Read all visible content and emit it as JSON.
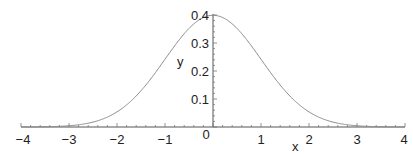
{
  "chart_data": {
    "type": "line",
    "title": "",
    "xlabel": "x",
    "ylabel": "y",
    "xlim": [
      -4,
      4
    ],
    "ylim": [
      0,
      0.4
    ],
    "grid": false,
    "legend": null,
    "x_ticks": [
      -4,
      -3,
      -2,
      -1,
      0,
      1,
      2,
      3,
      4
    ],
    "x_tick_labels": [
      "-4",
      "-3",
      "-2",
      "-1",
      "0",
      "1",
      "2",
      "3",
      "4"
    ],
    "y_ticks": [
      0.1,
      0.2,
      0.3,
      0.4
    ],
    "y_tick_labels": [
      "0.1",
      "0.2",
      "0.3",
      "0.4"
    ],
    "series": [
      {
        "name": "standard normal density",
        "function": "exp(-x^2/2)/sqrt(2*pi)",
        "x": [
          -4,
          -3.5,
          -3,
          -2.5,
          -2,
          -1.5,
          -1,
          -0.5,
          0,
          0.5,
          1,
          1.5,
          2,
          2.5,
          3,
          3.5,
          4
        ],
        "values": [
          0.0001,
          0.0009,
          0.0044,
          0.0175,
          0.054,
          0.1295,
          0.242,
          0.3521,
          0.3989,
          0.3521,
          0.242,
          0.1295,
          0.054,
          0.0175,
          0.0044,
          0.0009,
          0.0001
        ],
        "color": "#8a8a8a"
      }
    ]
  },
  "colors": {
    "axis": "#555555",
    "curve": "#8a8a8a",
    "text": "#222222"
  }
}
